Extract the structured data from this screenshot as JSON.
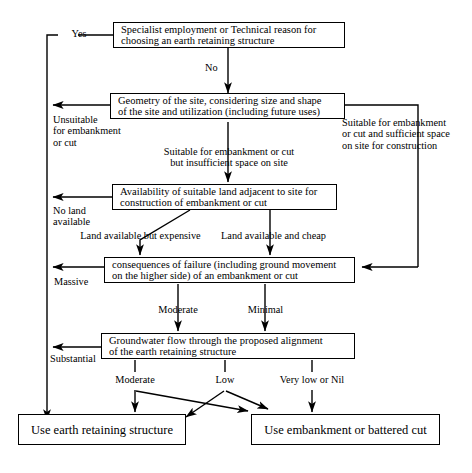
{
  "diagram": {
    "nodes": [
      {
        "id": "specialist",
        "label": "Specialist employment or Technical reason for\nchoosing an earth retaining structure"
      },
      {
        "id": "geometry",
        "label": "Geometry of the site, considering size and shape\nof the site and utilization (including future uses)"
      },
      {
        "id": "availability",
        "label": "Availability of suitable land adjacent to site for\nconstruction of embankment or cut"
      },
      {
        "id": "consequences",
        "label": "consequences of failure (including ground movement\non the higher side) of an embankment or cut"
      },
      {
        "id": "groundwater",
        "label": "Groundwater flow through the proposed alignment\nof the earth retaining structure"
      },
      {
        "id": "use-retaining",
        "label": "Use earth retaining structure"
      },
      {
        "id": "use-embankment",
        "label": "Use embankment or battered cut"
      }
    ],
    "edge_labels": [
      {
        "id": "yes",
        "text": "Yes"
      },
      {
        "id": "no",
        "text": "No"
      },
      {
        "id": "unsuitable",
        "text": "Unsuitable\nfor embankment\nor cut"
      },
      {
        "id": "suitable-insufficient",
        "text": "Suitable for embankment or cut\nbut insufficient space on site"
      },
      {
        "id": "suitable-sufficient",
        "text": "Suitable for embankment\nor cut and sufficient space\non site for construction"
      },
      {
        "id": "no-land",
        "text": "No land\navailable"
      },
      {
        "id": "land-expensive",
        "text": "Land available but expensive"
      },
      {
        "id": "land-cheap",
        "text": "Land available and cheap"
      },
      {
        "id": "massive",
        "text": "Massive"
      },
      {
        "id": "moderate-consequence",
        "text": "Moderate"
      },
      {
        "id": "minimal",
        "text": "Minimal"
      },
      {
        "id": "substantial",
        "text": "Substantial"
      },
      {
        "id": "moderate-flow",
        "text": "Moderate"
      },
      {
        "id": "low",
        "text": "Low"
      },
      {
        "id": "very-low-nil",
        "text": "Very low or Nil"
      }
    ],
    "colors": {
      "line": "#000000",
      "box_border": "#000000",
      "background": "#ffffff",
      "text": "#000000"
    }
  }
}
